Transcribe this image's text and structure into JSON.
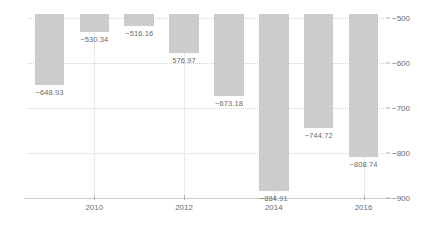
{
  "chart_data": {
    "type": "bar",
    "title": "",
    "xlabel": "",
    "ylabel": "",
    "categories": [
      2009,
      2010,
      2011,
      2012,
      2013,
      2014,
      2015,
      2016
    ],
    "values": [
      -648.93,
      -530.34,
      -516.16,
      -576.97,
      -673.18,
      -884.91,
      -744.72,
      -808.74
    ],
    "data_labels": [
      "−648.93",
      "−530.34",
      "−516.16",
      "576.97",
      "−673.18",
      "−884.91",
      "−744.72",
      "−808.74"
    ],
    "ylim": [
      -900,
      -490
    ],
    "y_ticks": [
      -500,
      -600,
      -700,
      -800,
      -900
    ],
    "y_tick_labels": [
      "−500",
      "−600",
      "−700",
      "−800",
      "−900"
    ],
    "y_axis_position": "right",
    "x_ticks": [
      2010,
      2012,
      2014,
      2016
    ],
    "x_tick_labels": [
      "2010",
      "2012",
      "2014",
      "2016"
    ],
    "grid": "dotted",
    "legend": "none",
    "bars_clipped_top": true,
    "colors": {
      "bar_fill": "#cccccc",
      "gridline": "#d9d4cf",
      "text": "#6b6b6b",
      "axis": "#cfcac5",
      "background": "#ffffff"
    }
  }
}
